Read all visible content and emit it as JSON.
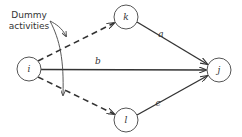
{
  "diagram": {
    "type": "activity-network",
    "nodes": [
      {
        "id": "i",
        "label": "i"
      },
      {
        "id": "k",
        "label": "k"
      },
      {
        "id": "l",
        "label": "l"
      },
      {
        "id": "j",
        "label": "j"
      }
    ],
    "edges": [
      {
        "from": "i",
        "to": "k",
        "label": "",
        "style": "dashed",
        "kind": "dummy"
      },
      {
        "from": "i",
        "to": "l",
        "label": "",
        "style": "dashed",
        "kind": "dummy"
      },
      {
        "from": "k",
        "to": "j",
        "label": "a",
        "style": "solid"
      },
      {
        "from": "i",
        "to": "j",
        "label": "b",
        "style": "solid"
      },
      {
        "from": "l",
        "to": "j",
        "label": "c",
        "style": "solid"
      }
    ],
    "annotation": {
      "line1": "Dummy",
      "line2": "activities"
    },
    "colors": {
      "stroke": "#333333",
      "background": "#ffffff"
    }
  }
}
